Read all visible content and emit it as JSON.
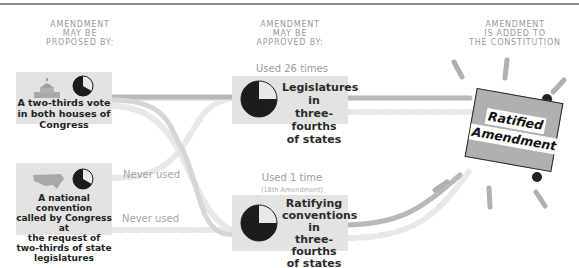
{
  "columns": {
    "proposed": [
      "AMENDMENT",
      "MAY BE",
      "PROPOSED BY:"
    ],
    "approved": [
      "AMENDMENT",
      "MAY BE",
      "APPROVED BY:"
    ],
    "added": [
      "AMENDMENT",
      "IS ADDED TO",
      "THE CONSTITUTION"
    ]
  },
  "proposal_methods": [
    {
      "icon": "capitol-icon",
      "fraction": "two-thirds",
      "lines": [
        "A two-thirds vote",
        "in both houses of",
        "Congress"
      ]
    },
    {
      "icon": "us-map-icon",
      "fraction": "two-thirds",
      "lines": [
        "A national convention",
        "called by Congress at",
        "the request of",
        "two-thirds of state",
        "legislatures"
      ]
    }
  ],
  "path_labels": {
    "never_used_1": "Never used",
    "never_used_2": "Never used"
  },
  "approval_methods": [
    {
      "usage": "Used 26 times",
      "usage_note": "",
      "fraction": "three-fourths",
      "lines": [
        "Legislatures in",
        "three-fourths",
        "of states"
      ]
    },
    {
      "usage": "Used 1 time",
      "usage_note": "(18th Amendment)",
      "fraction": "three-fourths",
      "lines": [
        "Ratifying",
        "conventions in",
        "three-fourths",
        "of states"
      ]
    }
  ],
  "result": {
    "lines": [
      "Ratified",
      "Amendment"
    ]
  },
  "colors": {
    "card_bg": "#e3e3e3",
    "pie_dark": "#1c1c1c",
    "pie_light": "#e8e8e8",
    "path_solid": "#b5b5b5",
    "path_faded": "#e6e6e6",
    "document": "#b0b0b0",
    "header_text": "#9a9a9a"
  }
}
